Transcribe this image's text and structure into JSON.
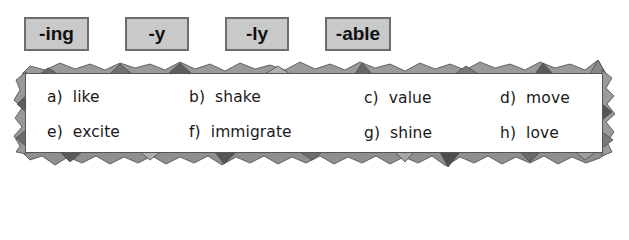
{
  "suffixes": [
    {
      "label": "-ing"
    },
    {
      "label": "-y"
    },
    {
      "label": "-ly"
    },
    {
      "label": "-able"
    }
  ],
  "words": [
    {
      "letter": "a)",
      "word": "like"
    },
    {
      "letter": "b)",
      "word": "shake"
    },
    {
      "letter": "c)",
      "word": "value"
    },
    {
      "letter": "d)",
      "word": "move"
    },
    {
      "letter": "e)",
      "word": "excite"
    },
    {
      "letter": "f)",
      "word": "immigrate"
    },
    {
      "letter": "g)",
      "word": "shine"
    },
    {
      "letter": "h)",
      "word": "love"
    }
  ],
  "colors": {
    "suffix_box_fill": "#c9c9c9",
    "suffix_box_border": "#6d6d6d",
    "frame_dark": "#555555",
    "frame_mid": "#8a8a8a",
    "frame_light": "#b5b5b5",
    "text": "#1a1a1a"
  }
}
